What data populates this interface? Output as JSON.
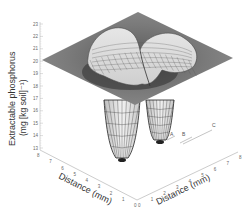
{
  "chart_data": {
    "type": "surface3d",
    "title": "",
    "zlabel": "Extractable phosphorus (mg [kg soil]⁻¹)",
    "xlabel": "Distance (mm)",
    "ylabel": "Distance (mm)",
    "zlim": [
      13,
      23
    ],
    "z_ticks": [
      "13",
      "14",
      "15",
      "16",
      "17",
      "18",
      "19",
      "20",
      "21",
      "22",
      "23"
    ],
    "x_ticks": [
      "8",
      "7",
      "6",
      "5",
      "4",
      "3",
      "2",
      "1",
      "0"
    ],
    "y_ticks": [
      "0",
      "1",
      "2",
      "3",
      "4",
      "5",
      "6",
      "7",
      "8"
    ],
    "xlim": [
      0,
      8
    ],
    "ylim": [
      0,
      8
    ],
    "baseline_level": 20.4,
    "features": [
      {
        "type": "ridge",
        "description": "Two-lobed raised ridge near center",
        "peak_z": 23
      },
      {
        "type": "depletion",
        "description": "Two deep depletion funnels below surface",
        "min_z": 13
      }
    ],
    "annotations": [
      "A",
      "B",
      "C"
    ],
    "grid": false,
    "legend": null
  }
}
